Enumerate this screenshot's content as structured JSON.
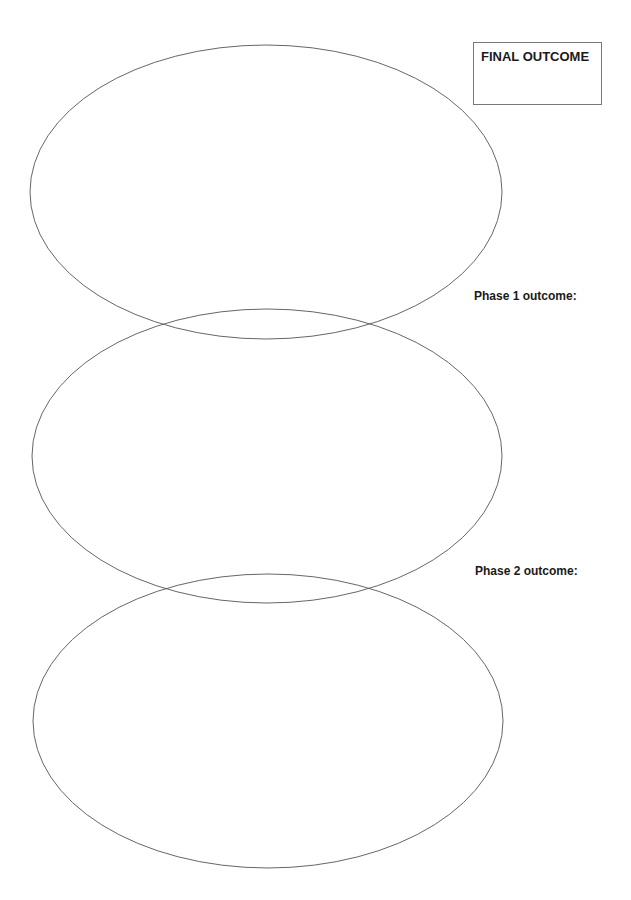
{
  "final_outcome": {
    "label": "FINAL OUTCOME"
  },
  "phases": [
    {
      "label": "Phase 1 outcome:"
    },
    {
      "label": "Phase 2 outcome:"
    }
  ],
  "ellipses": [
    {
      "name": "final-outcome-ellipse",
      "cx": 266,
      "cy": 192,
      "rx": 236,
      "ry": 147
    },
    {
      "name": "phase-1-ellipse",
      "cx": 267,
      "cy": 456,
      "rx": 235,
      "ry": 147
    },
    {
      "name": "phase-2-ellipse",
      "cx": 268,
      "cy": 721,
      "rx": 235,
      "ry": 147
    }
  ],
  "colors": {
    "stroke": "#555555",
    "text": "#1a1a1a",
    "box_border": "#777777"
  }
}
